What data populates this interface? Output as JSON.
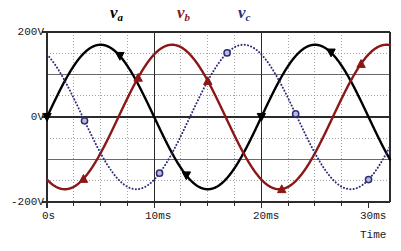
{
  "chart_data": {
    "type": "line",
    "title": "",
    "xlabel": "Time",
    "ylabel": "",
    "xlim_ms": [
      0,
      32
    ],
    "ylim_v": [
      -200,
      200
    ],
    "grid": true,
    "legend_position": "top",
    "x_unit": "ms",
    "y_unit": "V",
    "period_ms": 20,
    "amplitude_v": 170,
    "x_tick_labels": [
      "0s",
      "10ms",
      "20ms",
      "30ms"
    ],
    "x_tick_values_ms": [
      0,
      10,
      20,
      30
    ],
    "x_minor_step_ms": 2.5,
    "y_tick_labels": [
      "200V",
      "0V",
      "-200V"
    ],
    "y_tick_values_v": [
      200,
      0,
      -200
    ],
    "y_minor_step_v": 50,
    "series": [
      {
        "name": "v_a",
        "label_base": "v",
        "label_sub": "a",
        "color": "#000000",
        "style": "solid",
        "marker": "triangle-down",
        "phase_deg": 0,
        "amplitude_v": 170,
        "period_ms": 20,
        "marker_points_ms": [
          0.0,
          6.8,
          13.0,
          20.0,
          26.5
        ],
        "marker_points_v": [
          0,
          100,
          -170,
          0,
          0
        ]
      },
      {
        "name": "v_b",
        "label_base": "v",
        "label_sub": "b",
        "color": "#8c1717",
        "style": "solid",
        "marker": "triangle-up",
        "phase_deg": -120,
        "amplitude_v": 170,
        "period_ms": 20,
        "marker_points_ms": [
          3.4,
          8.5,
          15.0,
          21.9,
          29.3
        ],
        "marker_points_v": [
          -140,
          150,
          -70,
          -70,
          140
        ]
      },
      {
        "name": "v_c",
        "label_base": "v",
        "label_sub": "c",
        "color": "#2c2c78",
        "style": "dotted",
        "marker": "circle",
        "phase_deg": 120,
        "amplitude_v": 170,
        "period_ms": 20,
        "marker_points_ms": [
          3.5,
          10.5,
          16.8,
          23.2,
          30.0
        ],
        "marker_points_v": [
          -70,
          -35,
          150,
          -140,
          60
        ]
      }
    ]
  },
  "legend": {
    "items": [
      {
        "base": "v",
        "sub": "a"
      },
      {
        "base": "v",
        "sub": "b"
      },
      {
        "base": "v",
        "sub": "c"
      }
    ]
  },
  "axes": {
    "y_top": "200V",
    "y_mid": "0V",
    "y_bottom": "-200V",
    "x0": "0s",
    "x1": "10ms",
    "x2": "20ms",
    "x3": "30ms",
    "x_axis_title": "Time"
  },
  "colors": {
    "va": "#000000",
    "vb": "#8c1717",
    "vc": "#2c2c78",
    "axis": "#3a3a3a",
    "grid_minor": "#8a8a8a",
    "grid_major": "#5a5a5a",
    "background": "#ffffff"
  }
}
